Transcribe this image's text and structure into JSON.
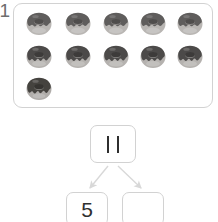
{
  "worksheet": {
    "problem_number": "1",
    "total_count": 11
  },
  "tray": {
    "label": "donut-tray",
    "rows": [
      {
        "count": 5,
        "items": [
          "donut",
          "donut",
          "donut",
          "donut",
          "donut"
        ]
      },
      {
        "count": 5,
        "items": [
          "donut",
          "donut",
          "donut",
          "donut",
          "donut"
        ]
      },
      {
        "count": 1,
        "items": [
          "donut"
        ]
      }
    ],
    "icon_name": "donut-icon",
    "colors": {
      "dough": "#b9b6b3",
      "dough_shadow": "#9d9a97",
      "frosting": "#5f5d5c",
      "highlight": "#e3e1df",
      "hole": "#8f8c8a",
      "border": "#d2d2d2"
    }
  },
  "number_bond": {
    "whole": {
      "value": "11",
      "stroke_count": 2,
      "filled": true
    },
    "parts": [
      {
        "value": "5",
        "filled": true
      },
      {
        "value": "",
        "filled": false
      }
    ],
    "arrow_color": "#d8d8d8",
    "box_border_color": "#d2d2d2"
  }
}
